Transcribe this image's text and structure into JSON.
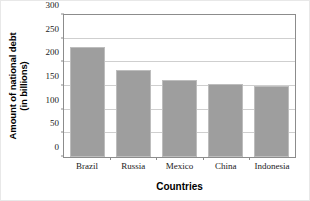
{
  "chart_data": {
    "type": "bar",
    "title": "",
    "xlabel": "Countries",
    "ylabel_line1": "Amount of national debt",
    "ylabel_line2": "(in billions)",
    "categories": [
      "Brazil",
      "Russia",
      "Mexico",
      "China",
      "Indonesia"
    ],
    "values": [
      232,
      184,
      162,
      155,
      151
    ],
    "ylim": [
      0,
      300
    ],
    "yticks": [
      0,
      50,
      100,
      150,
      200,
      250,
      300
    ],
    "ytick_labels": [
      "0",
      "50",
      "100",
      "150",
      "200",
      "250",
      "300"
    ],
    "grid": true,
    "legend": "none",
    "series_color": "#9e9e9e",
    "grid_color": "#cfcfcf",
    "axis_color": "#8c8c8c"
  }
}
